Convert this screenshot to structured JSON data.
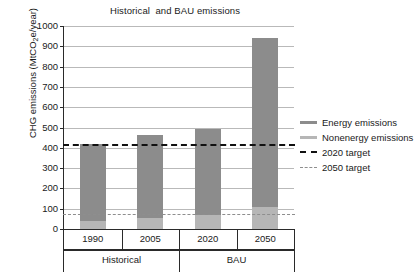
{
  "chart_data": {
    "type": "bar",
    "title": "Historical  and BAU emissions",
    "xlabel": "",
    "ylabel": "CHG emissions (MtCO2e/year)",
    "ylabel_prefix": "CHG emissions (MtCO",
    "ylabel_sub": "2",
    "ylabel_suffix": "e/year)",
    "categories": [
      "1990",
      "2005",
      "2020",
      "2050"
    ],
    "groups": [
      {
        "label": "Historical",
        "categories": [
          "1990",
          "2005"
        ]
      },
      {
        "label": "BAU",
        "categories": [
          "2020",
          "2050"
        ]
      }
    ],
    "stacked": true,
    "series": [
      {
        "name": "Nonenergy emissions",
        "color": "#b6b6b6",
        "values": [
          40,
          55,
          70,
          110
        ]
      },
      {
        "name": "Energy emissions",
        "color": "#8c8c8c",
        "values": [
          380,
          410,
          425,
          830
        ]
      }
    ],
    "totals": [
      420,
      465,
      495,
      940
    ],
    "reference_lines": [
      {
        "name": "2020 target",
        "value": 420,
        "color": "#111111",
        "style": "dashed-thick"
      },
      {
        "name": "2050 target",
        "value": 75,
        "color": "#8e8e8e",
        "style": "dashed-thin"
      }
    ],
    "ylim": [
      0,
      1000
    ],
    "ytick_step": 100,
    "yticks": [
      0,
      100,
      200,
      300,
      400,
      500,
      600,
      700,
      800,
      900,
      1000
    ],
    "ytick_labels": [
      "0",
      "100",
      "200",
      "300",
      "400",
      "500",
      "600",
      "700",
      "800",
      "900",
      "1000"
    ],
    "grid": true,
    "legend_position": "right",
    "legend": [
      {
        "label": "Energy emissions",
        "swatch": "bar",
        "color": "#8c8c8c"
      },
      {
        "label": "Nonenergy emissions",
        "swatch": "bar",
        "color": "#b6b6b6"
      },
      {
        "label": "2020 target",
        "swatch": "dash-thick",
        "color": "#111111"
      },
      {
        "label": "2050 target",
        "swatch": "dash-thin",
        "color": "#8e8e8e"
      }
    ]
  }
}
